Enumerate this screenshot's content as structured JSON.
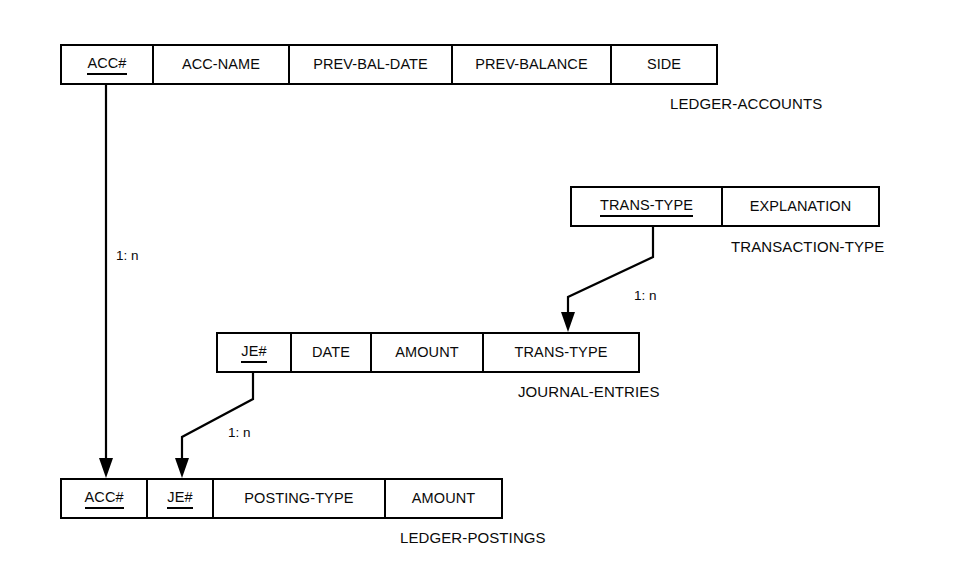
{
  "diagram": {
    "background_color": "#ffffff",
    "line_color": "#000000",
    "entities": [
      {
        "id": "ledger-accounts",
        "name": "LEDGER-ACCOUNTS",
        "attributes": [
          {
            "label": "ACC#",
            "primary_key": true
          },
          {
            "label": "ACC-NAME",
            "primary_key": false
          },
          {
            "label": "PREV-BAL-DATE",
            "primary_key": false
          },
          {
            "label": "PREV-BALANCE",
            "primary_key": false
          },
          {
            "label": "SIDE",
            "primary_key": false
          }
        ]
      },
      {
        "id": "transaction-type",
        "name": "TRANSACTION-TYPE",
        "attributes": [
          {
            "label": "TRANS-TYPE",
            "primary_key": true
          },
          {
            "label": "EXPLANATION",
            "primary_key": false
          }
        ]
      },
      {
        "id": "journal-entries",
        "name": "JOURNAL-ENTRIES",
        "attributes": [
          {
            "label": "JE#",
            "primary_key": true
          },
          {
            "label": "DATE",
            "primary_key": false
          },
          {
            "label": "AMOUNT",
            "primary_key": false
          },
          {
            "label": "TRANS-TYPE",
            "primary_key": false
          }
        ]
      },
      {
        "id": "ledger-postings",
        "name": "LEDGER-POSTINGS",
        "attributes": [
          {
            "label": "ACC#",
            "primary_key": true
          },
          {
            "label": "JE#",
            "primary_key": true
          },
          {
            "label": "POSTING-TYPE",
            "primary_key": false
          },
          {
            "label": "AMOUNT",
            "primary_key": false
          }
        ]
      }
    ],
    "relationships": [
      {
        "id": "accounts-to-postings",
        "from": "ledger-accounts.ACC#",
        "to": "ledger-postings.ACC#",
        "cardinality": "1: n"
      },
      {
        "id": "transtype-to-journal",
        "from": "transaction-type.TRANS-TYPE",
        "to": "journal-entries.TRANS-TYPE",
        "cardinality": "1: n"
      },
      {
        "id": "journal-to-postings",
        "from": "journal-entries.JE#",
        "to": "ledger-postings.JE#",
        "cardinality": "1: n"
      }
    ]
  }
}
